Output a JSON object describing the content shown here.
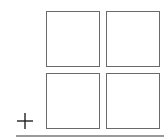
{
  "grid": {
    "rows": 2,
    "cols": 2,
    "tiles": [
      {
        "position": "top-left"
      },
      {
        "position": "top-right"
      },
      {
        "position": "bottom-left"
      },
      {
        "position": "bottom-right"
      }
    ]
  },
  "icons": {
    "add": "plus-icon"
  },
  "colors": {
    "tile_border": "#6a6a6a",
    "plus": "#222222",
    "baseline": "#9a9a9a"
  }
}
